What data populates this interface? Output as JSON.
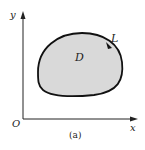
{
  "figure": {
    "caption": "(a)",
    "axes": {
      "x_label": "x",
      "y_label": "y",
      "origin_label": "O"
    },
    "region": {
      "label": "D",
      "fill": "#d9d9d9",
      "stroke": "#111111"
    },
    "curve": {
      "label": "L",
      "orientation_arrow": "counterclockwise"
    }
  }
}
